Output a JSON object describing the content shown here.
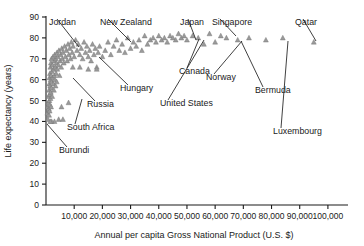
{
  "chart_data": {
    "type": "scatter",
    "title": "",
    "xlabel": "Annual per capita Gross National Product (U.S. $)",
    "ylabel": "Life expectancy (years)",
    "xlim": [
      0,
      105000
    ],
    "ylim": [
      0,
      90
    ],
    "grid": false,
    "legend": "none",
    "marker_shape": "triangle",
    "marker_color": "#9a9a9a",
    "xticks": [
      {
        "value": 10000,
        "label": "10,000"
      },
      {
        "value": 20000,
        "label": "20,000"
      },
      {
        "value": 30000,
        "label": "30,000"
      },
      {
        "value": 40000,
        "label": "40,000"
      },
      {
        "value": 50000,
        "label": "50,000"
      },
      {
        "value": 60000,
        "label": "60,000"
      },
      {
        "value": 70000,
        "label": "70,000"
      },
      {
        "value": 80000,
        "label": "80,000"
      },
      {
        "value": 90000,
        "label": "90,000"
      },
      {
        "value": 100000,
        "label": "100,000"
      }
    ],
    "yticks": [
      {
        "value": 0,
        "label": "0"
      },
      {
        "value": 10,
        "label": "10"
      },
      {
        "value": 20,
        "label": "20"
      },
      {
        "value": 30,
        "label": "30"
      },
      {
        "value": 40,
        "label": "40"
      },
      {
        "value": 50,
        "label": "50"
      },
      {
        "value": 60,
        "label": "60"
      },
      {
        "value": 70,
        "label": "70"
      },
      {
        "value": 80,
        "label": "80"
      },
      {
        "value": 90,
        "label": "90"
      }
    ],
    "points": [
      [
        500,
        44
      ],
      [
        600,
        47
      ],
      [
        700,
        41
      ],
      [
        800,
        49
      ],
      [
        900,
        52
      ],
      [
        1000,
        46
      ],
      [
        1050,
        55
      ],
      [
        1100,
        43
      ],
      [
        1150,
        58
      ],
      [
        1200,
        50
      ],
      [
        1250,
        61
      ],
      [
        1300,
        45
      ],
      [
        1350,
        53
      ],
      [
        1400,
        63
      ],
      [
        1450,
        48
      ],
      [
        1500,
        57
      ],
      [
        1550,
        66
      ],
      [
        1600,
        51
      ],
      [
        1650,
        60
      ],
      [
        1700,
        54
      ],
      [
        1750,
        68
      ],
      [
        1800,
        47
      ],
      [
        1850,
        62
      ],
      [
        1900,
        56
      ],
      [
        1950,
        70
      ],
      [
        2000,
        59
      ],
      [
        2100,
        64
      ],
      [
        2200,
        52
      ],
      [
        2300,
        67
      ],
      [
        2400,
        61
      ],
      [
        2500,
        71
      ],
      [
        2600,
        58
      ],
      [
        2700,
        65
      ],
      [
        2800,
        55
      ],
      [
        2900,
        69
      ],
      [
        3000,
        62
      ],
      [
        3100,
        72
      ],
      [
        3200,
        60
      ],
      [
        3300,
        66
      ],
      [
        3400,
        57
      ],
      [
        3500,
        70
      ],
      [
        3600,
        63
      ],
      [
        3700,
        68
      ],
      [
        3800,
        59
      ],
      [
        3900,
        73
      ],
      [
        4000,
        65
      ],
      [
        4200,
        71
      ],
      [
        4400,
        67
      ],
      [
        4600,
        74
      ],
      [
        4800,
        62
      ],
      [
        5000,
        69
      ],
      [
        5200,
        72
      ],
      [
        5400,
        66
      ],
      [
        5600,
        75
      ],
      [
        5800,
        70
      ],
      [
        6000,
        73
      ],
      [
        6300,
        68
      ],
      [
        6600,
        76
      ],
      [
        6900,
        71
      ],
      [
        7200,
        74
      ],
      [
        7500,
        69
      ],
      [
        7800,
        77
      ],
      [
        8100,
        72
      ],
      [
        8400,
        75
      ],
      [
        8700,
        70
      ],
      [
        9000,
        78
      ],
      [
        9300,
        73
      ],
      [
        9600,
        76
      ],
      [
        10000,
        71
      ],
      [
        10500,
        79
      ],
      [
        11000,
        74
      ],
      [
        11500,
        77
      ],
      [
        12000,
        72
      ],
      [
        12500,
        75
      ],
      [
        13000,
        70
      ],
      [
        13500,
        78
      ],
      [
        14000,
        73
      ],
      [
        14500,
        76
      ],
      [
        15000,
        71
      ],
      [
        15500,
        74
      ],
      [
        16000,
        69
      ],
      [
        16500,
        77
      ],
      [
        17000,
        72
      ],
      [
        17500,
        75
      ],
      [
        18000,
        66
      ],
      [
        18500,
        73
      ],
      [
        19000,
        76
      ],
      [
        20000,
        71
      ],
      [
        21000,
        74
      ],
      [
        22000,
        78
      ],
      [
        23000,
        72
      ],
      [
        24000,
        76
      ],
      [
        25000,
        79
      ],
      [
        26000,
        74
      ],
      [
        27000,
        77
      ],
      [
        28000,
        73
      ],
      [
        29000,
        80
      ],
      [
        30000,
        75
      ],
      [
        31000,
        78
      ],
      [
        32000,
        76
      ],
      [
        33000,
        79
      ],
      [
        34000,
        74
      ],
      [
        35000,
        81
      ],
      [
        36000,
        77
      ],
      [
        37000,
        79
      ],
      [
        38000,
        80
      ],
      [
        39000,
        78
      ],
      [
        40000,
        81
      ],
      [
        41000,
        79
      ],
      [
        42000,
        80
      ],
      [
        43000,
        78
      ],
      [
        44000,
        81
      ],
      [
        45000,
        80
      ],
      [
        46000,
        79
      ],
      [
        47000,
        82
      ],
      [
        48000,
        80
      ],
      [
        49000,
        81
      ],
      [
        50000,
        79
      ],
      [
        52000,
        81
      ],
      [
        54000,
        80
      ],
      [
        56000,
        77
      ],
      [
        58000,
        82
      ],
      [
        60000,
        78
      ],
      [
        62000,
        81
      ],
      [
        8000,
        49
      ],
      [
        5500,
        47
      ],
      [
        9500,
        66
      ],
      [
        12000,
        66
      ],
      [
        15000,
        65
      ],
      [
        18000,
        65
      ],
      [
        4500,
        41
      ],
      [
        6000,
        41
      ],
      [
        3000,
        40
      ],
      [
        2000,
        40
      ],
      [
        1500,
        40
      ],
      [
        64000,
        80
      ],
      [
        68000,
        79
      ],
      [
        72000,
        80
      ],
      [
        78000,
        79
      ],
      [
        84000,
        80
      ],
      [
        95000,
        78
      ]
    ],
    "annotations": [
      {
        "label": "Jordan",
        "lx": 49,
        "ly": 17,
        "px": 79,
        "py": 47
      },
      {
        "label": "New Zealand",
        "lx": 100,
        "ly": 17,
        "px": 131,
        "py": 42
      },
      {
        "label": "Japan",
        "lx": 180,
        "ly": 17,
        "px": 196,
        "py": 40
      },
      {
        "label": "Singapore",
        "lx": 212,
        "ly": 17,
        "px": 236,
        "py": 36
      },
      {
        "label": "Qatar",
        "lx": 295,
        "ly": 17,
        "px": 316,
        "py": 41
      },
      {
        "label": "Canada",
        "lx": 179,
        "ly": 66,
        "px": 199,
        "py": 39
      },
      {
        "label": "Norway",
        "lx": 206,
        "ly": 72,
        "px": 242,
        "py": 41
      },
      {
        "label": "Hungary",
        "lx": 120,
        "ly": 83,
        "px": 99,
        "py": 57
      },
      {
        "label": "United States",
        "lx": 160,
        "ly": 98,
        "px": 204,
        "py": 40
      },
      {
        "label": "Bermuda",
        "lx": 255,
        "ly": 85,
        "px": 241,
        "py": 41
      },
      {
        "label": "Luxembourg",
        "lx": 273,
        "ly": 126,
        "px": 288,
        "py": 41
      },
      {
        "label": "Russia",
        "lx": 87,
        "ly": 99,
        "px": 73,
        "py": 78
      },
      {
        "label": "South Africa",
        "lx": 67,
        "ly": 122,
        "px": 82,
        "py": 99
      },
      {
        "label": "Burundi",
        "lx": 59,
        "ly": 145,
        "px": 47,
        "py": 124
      }
    ]
  }
}
